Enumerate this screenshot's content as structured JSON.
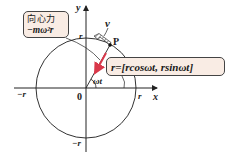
{
  "diagram": {
    "type": "uniform-circular-motion",
    "axes": {
      "x_label": "x",
      "y_label": "y",
      "origin_label": "0",
      "x_pos_tick": "r",
      "x_neg_tick": "−r",
      "y_pos_tick": "r",
      "y_neg_tick": "−r"
    },
    "point_label": "P",
    "velocity_label": "v",
    "angle_label": "ωt",
    "centripetal_box": {
      "line1": "向心力",
      "line2": "−mω²r"
    },
    "position_box": {
      "text": "r=[rcosωt,  rsinωt]"
    },
    "colors": {
      "box_fill": "#f9ece4",
      "force_arrow": "#d9384a",
      "line": "#333333"
    }
  }
}
